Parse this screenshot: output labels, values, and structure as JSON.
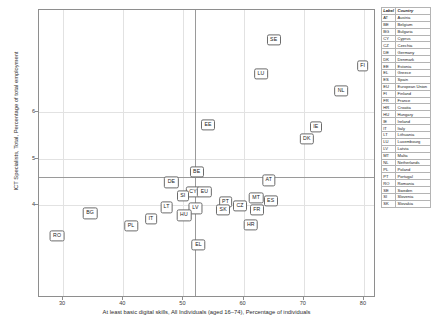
{
  "chart_data": {
    "type": "scatter",
    "title": "",
    "xlabel": "At least basic digital skills, All Individuals (aged 16–74), Percentage of individuals",
    "ylabel": "ICT Specialists, Total, Percentage of total employment",
    "xlim": [
      26,
      82
    ],
    "ylim": [
      2.0,
      8.2
    ],
    "xticks": [
      30,
      40,
      50,
      60,
      70,
      80
    ],
    "yticks": [
      6,
      5,
      4
    ],
    "grid": true,
    "legend_position": "right",
    "reference_lines": {
      "x": 52.0,
      "y": 4.6
    },
    "points": [
      {
        "label": "SE",
        "country": "Sweden",
        "x": 65.0,
        "y": 7.55
      },
      {
        "label": "FI",
        "country": "Finland",
        "x": 79.8,
        "y": 7.0
      },
      {
        "label": "LU",
        "country": "Luxembourg",
        "x": 62.9,
        "y": 6.83
      },
      {
        "label": "NL",
        "country": "Netherlands",
        "x": 76.2,
        "y": 6.46
      },
      {
        "label": "EE",
        "country": "Estonia",
        "x": 54.1,
        "y": 5.72
      },
      {
        "label": "IE",
        "country": "Ireland",
        "x": 72.0,
        "y": 5.68
      },
      {
        "label": "DK",
        "country": "Denmark",
        "x": 70.5,
        "y": 5.43
      },
      {
        "label": "BE",
        "country": "Belgium",
        "x": 52.2,
        "y": 4.72
      },
      {
        "label": "AT",
        "country": "Austria",
        "x": 64.2,
        "y": 4.53
      },
      {
        "label": "DE",
        "country": "Germany",
        "x": 48.0,
        "y": 4.49
      },
      {
        "label": "CY",
        "country": "Cyprus",
        "x": 51.6,
        "y": 4.29
      },
      {
        "label": "EU",
        "country": "European Union",
        "x": 53.5,
        "y": 4.28
      },
      {
        "label": "SI",
        "country": "Slovenia",
        "x": 49.9,
        "y": 4.19
      },
      {
        "label": "MT",
        "country": "Malta",
        "x": 62.1,
        "y": 4.15
      },
      {
        "label": "ES",
        "country": "Spain",
        "x": 64.5,
        "y": 4.09
      },
      {
        "label": "PT",
        "country": "Portugal",
        "x": 57.0,
        "y": 4.07
      },
      {
        "label": "CZ",
        "country": "Czechia",
        "x": 59.4,
        "y": 3.99
      },
      {
        "label": "LT",
        "country": "Lithuania",
        "x": 47.2,
        "y": 3.95
      },
      {
        "label": "LV",
        "country": "Latvia",
        "x": 52.0,
        "y": 3.93
      },
      {
        "label": "SK",
        "country": "Slovakia",
        "x": 56.6,
        "y": 3.9
      },
      {
        "label": "FR",
        "country": "France",
        "x": 62.2,
        "y": 3.89
      },
      {
        "label": "HU",
        "country": "Hungary",
        "x": 50.1,
        "y": 3.78
      },
      {
        "label": "BG",
        "country": "Bulgaria",
        "x": 34.5,
        "y": 3.82
      },
      {
        "label": "IT",
        "country": "Italy",
        "x": 44.6,
        "y": 3.7
      },
      {
        "label": "HR",
        "country": "Croatia",
        "x": 61.2,
        "y": 3.57
      },
      {
        "label": "PL",
        "country": "Poland",
        "x": 41.3,
        "y": 3.55
      },
      {
        "label": "RO",
        "country": "Romania",
        "x": 29.0,
        "y": 3.34
      },
      {
        "label": "EL",
        "country": "Greece",
        "x": 52.5,
        "y": 3.14
      }
    ]
  },
  "legend": {
    "headers": [
      "Label",
      "Country"
    ],
    "rows": [
      {
        "code": "AT",
        "country": "Austria"
      },
      {
        "code": "BE",
        "country": "Belgium"
      },
      {
        "code": "BG",
        "country": "Bulgaria"
      },
      {
        "code": "CY",
        "country": "Cyprus"
      },
      {
        "code": "CZ",
        "country": "Czechia"
      },
      {
        "code": "DE",
        "country": "Germany"
      },
      {
        "code": "DK",
        "country": "Denmark"
      },
      {
        "code": "EE",
        "country": "Estonia"
      },
      {
        "code": "EL",
        "country": "Greece"
      },
      {
        "code": "ES",
        "country": "Spain"
      },
      {
        "code": "EU",
        "country": "European Union"
      },
      {
        "code": "FI",
        "country": "Finland"
      },
      {
        "code": "FR",
        "country": "France"
      },
      {
        "code": "HR",
        "country": "Croatia"
      },
      {
        "code": "HU",
        "country": "Hungary"
      },
      {
        "code": "IE",
        "country": "Ireland"
      },
      {
        "code": "IT",
        "country": "Italy"
      },
      {
        "code": "LT",
        "country": "Lithuania"
      },
      {
        "code": "LU",
        "country": "Luxembourg"
      },
      {
        "code": "LV",
        "country": "Latvia"
      },
      {
        "code": "MT",
        "country": "Malta"
      },
      {
        "code": "NL",
        "country": "Netherlands"
      },
      {
        "code": "PL",
        "country": "Poland"
      },
      {
        "code": "PT",
        "country": "Portugal"
      },
      {
        "code": "RO",
        "country": "Romania"
      },
      {
        "code": "SE",
        "country": "Sweden"
      },
      {
        "code": "SI",
        "country": "Slovenia"
      },
      {
        "code": "SK",
        "country": "Slovakia"
      }
    ]
  }
}
